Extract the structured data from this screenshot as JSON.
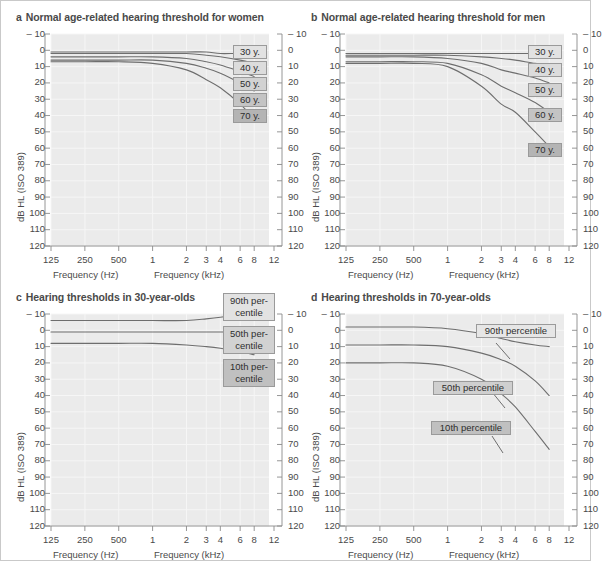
{
  "figure": {
    "background": "#ffffff",
    "border_color": "#c9c9c9",
    "plot_bg": "#ebebeb",
    "grid_color": "#f6f6f6",
    "curve_color": "#6e6e6e",
    "axis_color": "#8a8a8a",
    "text_color": "#4a4a4a"
  },
  "axes": {
    "y_axis_title": "dB HL (ISO 389)",
    "y_ticks": [
      "– 10",
      "0",
      "10",
      "20",
      "30",
      "40",
      "50",
      "60",
      "70",
      "80",
      "90",
      "100",
      "110",
      "120"
    ],
    "y_values": [
      -10,
      0,
      10,
      20,
      30,
      40,
      50,
      60,
      70,
      80,
      90,
      100,
      110,
      120
    ],
    "y_min": -10,
    "y_max": 120,
    "y_inverted": true,
    "x_ticks": [
      "125",
      "250",
      "500",
      "1",
      "2",
      "3",
      "4",
      "6",
      "8",
      "12"
    ],
    "x_values_hz": [
      125,
      250,
      500,
      1000,
      2000,
      3000,
      4000,
      6000,
      8000,
      12000
    ],
    "x_title_left": "Frequency (Hz)",
    "x_title_right": "Frequency (kHz)",
    "x_scale": "log"
  },
  "panels": [
    {
      "letter": "a",
      "title": "Normal age-related hearing threshold for women",
      "labels": [
        {
          "text": "30 y.",
          "fill": "#e2e2e2"
        },
        {
          "text": "40 y.",
          "fill": "#dcdcdc"
        },
        {
          "text": "50 y.",
          "fill": "#d2d2d2"
        },
        {
          "text": "60 y.",
          "fill": "#c4c4c4"
        },
        {
          "text": "70 y.",
          "fill": "#b4b4b4"
        }
      ]
    },
    {
      "letter": "b",
      "title": "Normal age-related hearing threshold for men",
      "labels": [
        {
          "text": "30 y.",
          "fill": "#e2e2e2"
        },
        {
          "text": "40 y.",
          "fill": "#dcdcdc"
        },
        {
          "text": "50 y.",
          "fill": "#d2d2d2"
        },
        {
          "text": "60 y.",
          "fill": "#c4c4c4"
        },
        {
          "text": "70 y.",
          "fill": "#b4b4b4"
        }
      ]
    },
    {
      "letter": "c",
      "title": "Hearing thresholds in 30-year-olds",
      "labels": [
        {
          "line1": "90th per-",
          "line2": "centile",
          "fill": "#e2e2e2"
        },
        {
          "line1": "50th per-",
          "line2": "centile",
          "fill": "#d2d2d2"
        },
        {
          "line1": "10th per-",
          "line2": "centile",
          "fill": "#c0c0c0"
        }
      ]
    },
    {
      "letter": "d",
      "title": "Hearing thresholds in 70-year-olds",
      "labels": [
        {
          "text": "90th percentile",
          "fill": "#e6e6e6"
        },
        {
          "text": "50th percentile",
          "fill": "#cfcfcf"
        },
        {
          "text": "10th percentile",
          "fill": "#c0c0c0"
        }
      ]
    }
  ],
  "chart_data": [
    {
      "panel": "a",
      "type": "line",
      "title": "Normal age-related hearing threshold for women",
      "xlabel": "Frequency (Hz) / Frequency (kHz)",
      "ylabel": "dB HL (ISO 389)",
      "xscale": "log",
      "x": [
        125,
        250,
        500,
        1000,
        2000,
        3000,
        4000,
        6000,
        8000
      ],
      "xlim": [
        125,
        12000
      ],
      "ylim": [
        -10,
        120
      ],
      "y_inverted": true,
      "grid": true,
      "legend": "inline-right",
      "series": [
        {
          "name": "30 y.",
          "values": [
            1,
            1,
            1,
            1,
            1,
            1,
            2,
            2,
            3
          ]
        },
        {
          "name": "40 y.",
          "values": [
            2,
            2,
            2,
            2,
            2,
            3,
            4,
            6,
            8
          ]
        },
        {
          "name": "50 y.",
          "values": [
            4,
            4,
            4,
            4,
            5,
            7,
            9,
            13,
            16
          ]
        },
        {
          "name": "60 y.",
          "values": [
            6,
            6,
            6,
            6,
            8,
            11,
            14,
            20,
            25
          ]
        },
        {
          "name": "70 y.",
          "values": [
            7,
            7,
            7,
            8,
            12,
            18,
            23,
            33,
            42
          ]
        }
      ]
    },
    {
      "panel": "b",
      "type": "line",
      "title": "Normal age-related hearing threshold for men",
      "xlabel": "Frequency (Hz) / Frequency (kHz)",
      "ylabel": "dB HL (ISO 389)",
      "xscale": "log",
      "x": [
        125,
        250,
        500,
        1000,
        2000,
        3000,
        4000,
        6000,
        8000
      ],
      "xlim": [
        125,
        12000
      ],
      "ylim": [
        -10,
        120
      ],
      "y_inverted": true,
      "grid": true,
      "legend": "inline-right",
      "series": [
        {
          "name": "30 y.",
          "values": [
            2,
            2,
            2,
            2,
            2,
            2,
            2,
            2,
            2
          ]
        },
        {
          "name": "40 y.",
          "values": [
            3,
            3,
            3,
            3,
            4,
            5,
            6,
            8,
            9
          ]
        },
        {
          "name": "50 y.",
          "values": [
            4,
            4,
            4,
            5,
            8,
            12,
            14,
            17,
            20
          ]
        },
        {
          "name": "60 y.",
          "values": [
            7,
            7,
            7,
            8,
            15,
            22,
            26,
            32,
            38
          ]
        },
        {
          "name": "70 y.",
          "values": [
            8,
            8,
            8,
            10,
            22,
            33,
            38,
            50,
            59
          ]
        }
      ]
    },
    {
      "panel": "c",
      "type": "line",
      "title": "Hearing thresholds in 30-year-olds",
      "xlabel": "Frequency (Hz) / Frequency (kHz)",
      "ylabel": "dB HL (ISO 389)",
      "xscale": "log",
      "x": [
        125,
        250,
        500,
        1000,
        2000,
        3000,
        4000,
        6000,
        8000
      ],
      "xlim": [
        125,
        12000
      ],
      "ylim": [
        -10,
        120
      ],
      "y_inverted": true,
      "grid": true,
      "legend": "inline-right",
      "series": [
        {
          "name": "90th percentile",
          "values": [
            -6,
            -6,
            -6,
            -6,
            -6,
            -7,
            -8,
            -10,
            -12
          ]
        },
        {
          "name": "50th percentile",
          "values": [
            1,
            1,
            1,
            1,
            1,
            1,
            1,
            1,
            1
          ]
        },
        {
          "name": "10th percentile",
          "values": [
            8,
            8,
            8,
            8,
            9,
            10,
            11,
            13,
            15
          ]
        }
      ]
    },
    {
      "panel": "d",
      "type": "line",
      "title": "Hearing thresholds in 70-year-olds",
      "xlabel": "Frequency (Hz) / Frequency (kHz)",
      "ylabel": "dB HL (ISO 389)",
      "xscale": "log",
      "x": [
        125,
        250,
        500,
        1000,
        2000,
        3000,
        4000,
        6000,
        8000
      ],
      "xlim": [
        125,
        12000
      ],
      "ylim": [
        -10,
        120
      ],
      "y_inverted": true,
      "grid": true,
      "legend": "inline-right",
      "series": [
        {
          "name": "90th percentile",
          "values": [
            -2,
            -2,
            -2,
            -1,
            2,
            5,
            7,
            9,
            10
          ]
        },
        {
          "name": "50th percentile",
          "values": [
            9,
            9,
            9,
            10,
            14,
            18,
            22,
            31,
            40
          ]
        },
        {
          "name": "10th percentile",
          "values": [
            20,
            20,
            20,
            22,
            30,
            39,
            47,
            62,
            73
          ]
        }
      ]
    }
  ]
}
